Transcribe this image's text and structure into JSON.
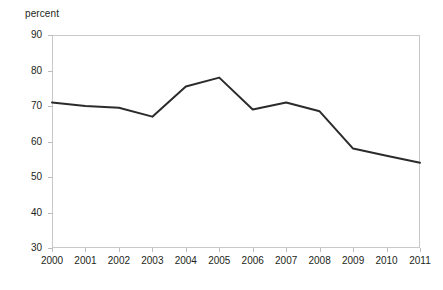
{
  "chart_data": {
    "type": "line",
    "title": "",
    "subtitle": "",
    "xlabel": "",
    "ylabel": "percent",
    "categories": [
      "2000",
      "2001",
      "2002",
      "2003",
      "2004",
      "2005",
      "2006",
      "2007",
      "2008",
      "2009",
      "2010",
      "2011"
    ],
    "values": [
      71,
      70,
      69.5,
      67,
      75.5,
      78,
      69,
      71,
      68.5,
      58,
      56,
      54
    ],
    "series": [
      {
        "name": "percent",
        "values": [
          71,
          70,
          69.5,
          67,
          75.5,
          78,
          69,
          71,
          68.5,
          58,
          56,
          54
        ]
      }
    ],
    "ylim": [
      30,
      90
    ],
    "xlim": [
      "2000",
      "2011"
    ],
    "y_ticks": [
      30,
      40,
      50,
      60,
      70,
      80,
      90
    ],
    "y_tick_labels": [
      "30",
      "40",
      "50",
      "60",
      "70",
      "80",
      "90"
    ],
    "x_ticks": [
      "2000",
      "2001",
      "2002",
      "2003",
      "2004",
      "2005",
      "2006",
      "2007",
      "2008",
      "2009",
      "2010",
      "2011"
    ],
    "grid": false,
    "legend": "none",
    "line_color": "#2b2b2b",
    "line_width": 2,
    "frame_color": "#c9c9c9",
    "tick_color": "#bdbdbd",
    "text_color": "#231f20",
    "background": "#ffffff"
  }
}
